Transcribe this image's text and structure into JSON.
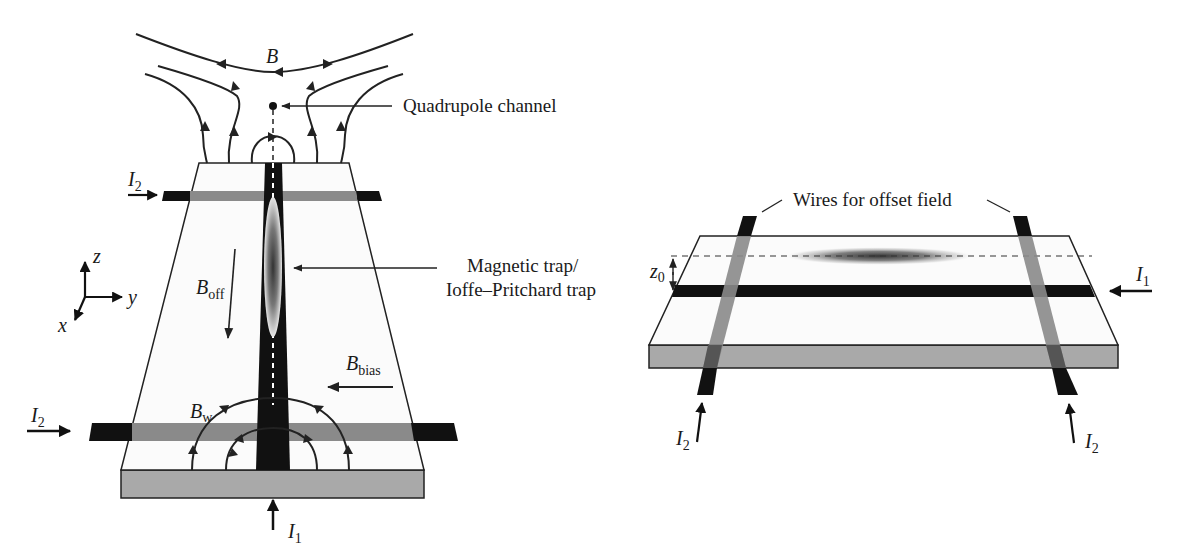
{
  "left_panel": {
    "field_label": "B",
    "quadrupole_label": "Quadrupole channel",
    "trap_label_line1": "Magnetic trap/",
    "trap_label_line2": "Ioffe–Pritchard trap",
    "axes": {
      "z": "z",
      "y": "y",
      "x": "x"
    },
    "b_off": {
      "main": "B",
      "sub": "off"
    },
    "b_bias": {
      "main": "B",
      "sub": "bias"
    },
    "b_w": {
      "main": "B",
      "sub": "w"
    },
    "i2_top": {
      "main": "I",
      "sub": "2"
    },
    "i2_bottom": {
      "main": "I",
      "sub": "2"
    },
    "i1": {
      "main": "I",
      "sub": "1"
    }
  },
  "right_panel": {
    "wires_label": "Wires for offset field",
    "z0": {
      "main": "z",
      "sub": "0"
    },
    "i1": {
      "main": "I",
      "sub": "1"
    },
    "i2_left": {
      "main": "I",
      "sub": "2"
    },
    "i2_right": {
      "main": "I",
      "sub": "2"
    }
  },
  "colors": {
    "wire": "#111111",
    "wire_under": "#8a8a8a",
    "substrate_side": "#a9a9a9",
    "surface": "#fbfbfb",
    "line": "#222222"
  }
}
